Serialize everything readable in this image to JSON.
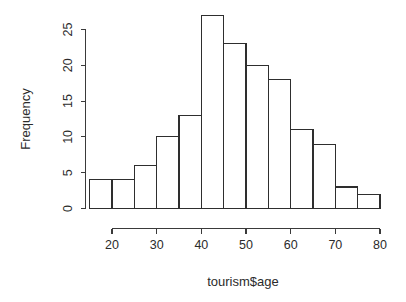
{
  "chart_data": {
    "type": "bar",
    "title": "",
    "subtitle": "",
    "xlabel": "tourism$age",
    "ylabel": "Frequency",
    "grid": false,
    "legend": "none",
    "bin_width": 5,
    "bin_edges": [
      15,
      20,
      25,
      30,
      35,
      40,
      45,
      50,
      55,
      60,
      65,
      70,
      75,
      80
    ],
    "categories": [
      "15-20",
      "20-25",
      "25-30",
      "30-35",
      "35-40",
      "40-45",
      "45-50",
      "50-55",
      "55-60",
      "60-65",
      "65-70",
      "70-75",
      "75-80"
    ],
    "values": [
      4,
      4,
      6,
      10,
      13,
      27,
      23,
      20,
      18,
      11,
      9,
      3,
      2
    ],
    "x": [
      15,
      20,
      25,
      30,
      35,
      40,
      45,
      50,
      55,
      60,
      65,
      70,
      75
    ],
    "xlim": [
      15,
      80
    ],
    "ylim": [
      0,
      27
    ],
    "yaxis_range": [
      0,
      25
    ],
    "xticks": [
      20,
      30,
      40,
      50,
      60,
      70,
      80
    ],
    "xtick_labels": [
      "20",
      "30",
      "40",
      "50",
      "60",
      "70",
      "80"
    ],
    "yticks": [
      0,
      5,
      10,
      15,
      20,
      25
    ],
    "ytick_labels": [
      "0",
      "5",
      "10",
      "15",
      "20",
      "25"
    ],
    "bar_fill_color": "#ffffff",
    "bar_stroke_color": "#2e2e2e",
    "axis_color": "#3a3a3a",
    "background_color": "#ffffff"
  },
  "axes": {
    "x_title": "tourism$age",
    "y_title": "Frequency"
  }
}
